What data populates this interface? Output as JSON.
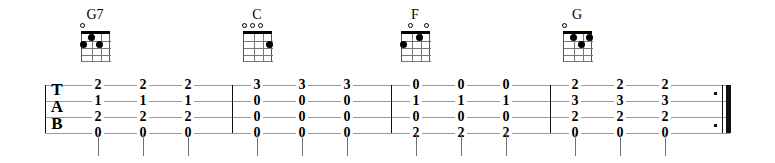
{
  "notation": {
    "type": "guitar-tablature",
    "clef_letters": [
      "T",
      "A",
      "B"
    ],
    "string_count": 4,
    "measure_count": 4,
    "end_barline": "repeat-end"
  },
  "chords": [
    {
      "name": "G7",
      "x": 72,
      "open_strings": [
        1
      ],
      "muted_strings": [],
      "dots": [
        {
          "string": 1,
          "fret": 2
        },
        {
          "string": 2,
          "fret": 1
        },
        {
          "string": 3,
          "fret": 2
        }
      ]
    },
    {
      "name": "C",
      "x": 234,
      "open_strings": [
        1,
        2,
        3
      ],
      "muted_strings": [],
      "dots": [
        {
          "string": 4,
          "fret": 2
        }
      ]
    },
    {
      "name": "F",
      "x": 392,
      "open_strings": [
        2,
        4
      ],
      "muted_strings": [],
      "dots": [
        {
          "string": 1,
          "fret": 2
        },
        {
          "string": 3,
          "fret": 1
        }
      ]
    },
    {
      "name": "G",
      "x": 554,
      "open_strings": [
        1
      ],
      "muted_strings": [],
      "dots": [
        {
          "string": 2,
          "fret": 1
        },
        {
          "string": 3,
          "fret": 2
        },
        {
          "string": 4,
          "fret": 1
        }
      ]
    }
  ],
  "measures": [
    {
      "index": 1,
      "chord": "G7",
      "columns": [
        {
          "x": 53,
          "frets": [
            "2",
            "1",
            "2",
            "0"
          ]
        },
        {
          "x": 98,
          "frets": [
            "2",
            "1",
            "2",
            "0"
          ]
        },
        {
          "x": 143,
          "frets": [
            "2",
            "1",
            "2",
            "0"
          ]
        }
      ]
    },
    {
      "index": 2,
      "chord": "C",
      "columns": [
        {
          "x": 212,
          "frets": [
            "3",
            "0",
            "0",
            "0"
          ]
        },
        {
          "x": 257,
          "frets": [
            "3",
            "0",
            "0",
            "0"
          ]
        },
        {
          "x": 302,
          "frets": [
            "3",
            "0",
            "0",
            "0"
          ]
        }
      ]
    },
    {
      "index": 3,
      "chord": "F",
      "columns": [
        {
          "x": 371,
          "frets": [
            "0",
            "1",
            "0",
            "2"
          ]
        },
        {
          "x": 416,
          "frets": [
            "0",
            "1",
            "0",
            "2"
          ]
        },
        {
          "x": 461,
          "frets": [
            "0",
            "1",
            "0",
            "2"
          ]
        }
      ]
    },
    {
      "index": 4,
      "chord": "G",
      "columns": [
        {
          "x": 530,
          "frets": [
            "2",
            "3",
            "2",
            "0"
          ]
        },
        {
          "x": 575,
          "frets": [
            "2",
            "3",
            "2",
            "0"
          ]
        },
        {
          "x": 620,
          "frets": [
            "2",
            "3",
            "2",
            "0"
          ]
        }
      ]
    }
  ],
  "barlines": [
    187,
    346,
    505
  ],
  "chart_data": {
    "type": "table",
    "categories": [
      "G7",
      "C",
      "F",
      "G"
    ],
    "series": [
      {
        "name": "string-1 (top line)",
        "values": [
          "2",
          "3",
          "0",
          "2"
        ]
      },
      {
        "name": "string-2",
        "values": [
          "1",
          "0",
          "1",
          "3"
        ]
      },
      {
        "name": "string-3",
        "values": [
          "2",
          "0",
          "0",
          "2"
        ]
      },
      {
        "name": "string-4 (bottom line)",
        "values": [
          "0",
          "0",
          "2",
          "0"
        ]
      }
    ],
    "beats_per_measure": 3,
    "xlabel": "Measure / Chord",
    "ylabel": "Fret number per string"
  }
}
